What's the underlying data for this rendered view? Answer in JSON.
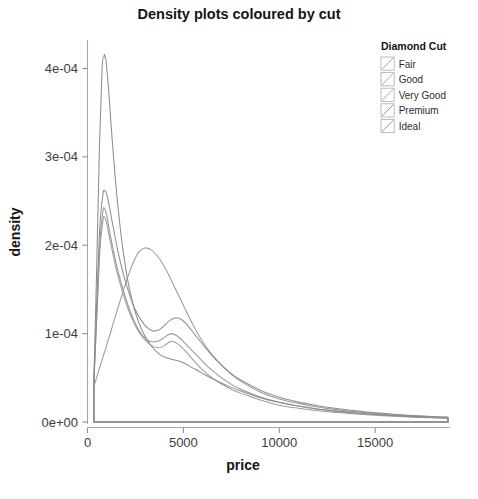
{
  "chart_data": {
    "type": "line",
    "title": "Density plots coloured by cut",
    "xlabel": "price",
    "ylabel": "density",
    "xlim": [
      0,
      18800
    ],
    "ylim": [
      0,
      0.00043
    ],
    "grid": false,
    "legend_position": "top-right",
    "legend_title": "Diamond Cut",
    "x_ticks": [
      {
        "value": 0,
        "label": "0"
      },
      {
        "value": 5000,
        "label": "5000"
      },
      {
        "value": 10000,
        "label": "10000"
      },
      {
        "value": 15000,
        "label": "15000"
      }
    ],
    "y_ticks": [
      {
        "value": 0.0,
        "label": "0e+00"
      },
      {
        "value": 0.0001,
        "label": "1e-04"
      },
      {
        "value": 0.0002,
        "label": "2e-04"
      },
      {
        "value": 0.0003,
        "label": "3e-04"
      },
      {
        "value": 0.0004,
        "label": "4e-04"
      }
    ],
    "series": [
      {
        "name": "Fair",
        "color": "#9a9a9a",
        "peak_price": 3050,
        "peak_density": 0.000197,
        "x": [
          330,
          600,
          900,
          1200,
          1500,
          1800,
          2100,
          2400,
          2700,
          3000,
          3300,
          3600,
          3900,
          4200,
          4600,
          5000,
          5500,
          6000,
          6500,
          7000,
          7500,
          8000,
          9000,
          10000,
          11000,
          12000,
          13000,
          14000,
          15000,
          16000,
          17000,
          18000,
          18800
        ],
        "y": [
          4e-05,
          5.9e-05,
          8e-05,
          0.000101,
          0.000123,
          0.000144,
          0.000164,
          0.000181,
          0.000193,
          0.000197,
          0.000195,
          0.000189,
          0.00018,
          0.000168,
          0.00015,
          0.000132,
          0.00011,
          9.1e-05,
          7.6e-05,
          6.4e-05,
          5.4e-05,
          4.6e-05,
          3.4e-05,
          2.6e-05,
          2.1e-05,
          1.7e-05,
          1.4e-05,
          1.15e-05,
          9.5e-06,
          8e-06,
          6.8e-06,
          5.8e-06,
          5e-06
        ]
      },
      {
        "name": "Good",
        "color": "#9d9d9d",
        "peak_price": 880,
        "peak_density": 0.000232,
        "x": [
          330,
          500,
          650,
          800,
          880,
          1000,
          1200,
          1500,
          1800,
          2100,
          2400,
          2700,
          3000,
          3300,
          3600,
          3900,
          4100,
          4350,
          4600,
          4900,
          5200,
          5600,
          6000,
          6500,
          7000,
          7600,
          8200,
          9000,
          10000,
          11000,
          12000,
          13000,
          14000,
          15000,
          16000,
          17000,
          18000,
          18800
        ],
        "y": [
          4.2e-05,
          0.000125,
          0.000195,
          0.000227,
          0.000232,
          0.000225,
          0.000203,
          0.000173,
          0.000149,
          0.000129,
          0.000113,
          0.000101,
          9.3e-05,
          8.7e-05,
          8.4e-05,
          8.5e-05,
          8.8e-05,
          9.1e-05,
          9e-05,
          8.5e-05,
          7.8e-05,
          6.8e-05,
          5.9e-05,
          5e-05,
          4.3e-05,
          3.6e-05,
          3.1e-05,
          2.5e-05,
          1.9e-05,
          1.55e-05,
          1.28e-05,
          1.08e-05,
          9e-06,
          7.6e-06,
          6.4e-06,
          5.5e-06,
          4.8e-06,
          4.3e-06
        ]
      },
      {
        "name": "Very Good",
        "color": "#979797",
        "peak_price": 880,
        "peak_density": 0.000242,
        "x": [
          330,
          500,
          650,
          800,
          880,
          1000,
          1200,
          1500,
          1800,
          2100,
          2400,
          2700,
          3000,
          3300,
          3600,
          3900,
          4150,
          4400,
          4700,
          5000,
          5400,
          5800,
          6300,
          6800,
          7400,
          8000,
          8800,
          9600,
          10500,
          11500,
          12500,
          13500,
          14500,
          15500,
          16500,
          17500,
          18300,
          18800
        ],
        "y": [
          4.3e-05,
          0.000132,
          0.000205,
          0.000238,
          0.000242,
          0.000234,
          0.00021,
          0.000179,
          0.000154,
          0.000133,
          0.000116,
          0.000103,
          9.5e-05,
          9.1e-05,
          9.1e-05,
          9.4e-05,
          9.8e-05,
          0.0001,
          9.7e-05,
          9.1e-05,
          8.2e-05,
          7.3e-05,
          6.2e-05,
          5.3e-05,
          4.4e-05,
          3.7e-05,
          3e-05,
          2.45e-05,
          2e-05,
          1.62e-05,
          1.33e-05,
          1.1e-05,
          9.2e-06,
          7.7e-06,
          6.5e-06,
          5.5e-06,
          4.9e-06,
          4.6e-06
        ]
      },
      {
        "name": "Premium",
        "color": "#8f8f8f",
        "peak_price": 900,
        "peak_density": 0.000262,
        "x": [
          330,
          500,
          650,
          800,
          900,
          1050,
          1250,
          1550,
          1850,
          2150,
          2450,
          2800,
          3100,
          3400,
          3700,
          4000,
          4300,
          4600,
          4900,
          5200,
          5600,
          6000,
          6500,
          7000,
          7600,
          8200,
          9000,
          10000,
          11000,
          12000,
          13000,
          14000,
          15000,
          16000,
          17000,
          18000,
          18800
        ],
        "y": [
          4.5e-05,
          0.000145,
          0.000224,
          0.000257,
          0.000262,
          0.000254,
          0.000231,
          0.000197,
          0.000169,
          0.000147,
          0.000129,
          0.000115,
          0.000107,
          0.000103,
          0.000104,
          0.000109,
          0.000115,
          0.000118,
          0.000116,
          0.00011,
          9.9e-05,
          8.8e-05,
          7.5e-05,
          6.4e-05,
          5.3e-05,
          4.5e-05,
          3.6e-05,
          2.8e-05,
          2.25e-05,
          1.85e-05,
          1.52e-05,
          1.26e-05,
          1.05e-05,
          8.8e-06,
          7.4e-06,
          6.2e-06,
          5.5e-06
        ]
      },
      {
        "name": "Ideal",
        "color": "#8c8c8c",
        "peak_price": 900,
        "peak_density": 0.000415,
        "x": [
          330,
          480,
          620,
          760,
          860,
          900,
          980,
          1100,
          1300,
          1550,
          1800,
          2100,
          2400,
          2700,
          3000,
          3400,
          3800,
          4200,
          4600,
          5000,
          5500,
          6000,
          6600,
          7200,
          8000,
          9000,
          10000,
          11000,
          12000,
          13000,
          14000,
          15000,
          16000,
          17000,
          18000,
          18800
        ],
        "y": [
          4.6e-05,
          0.000175,
          0.00031,
          0.0004,
          0.000414,
          0.000415,
          0.000406,
          0.000376,
          0.000316,
          0.000252,
          0.000203,
          0.00016,
          0.000131,
          0.000111,
          9.7e-05,
          8.4e-05,
          7.6e-05,
          7.2e-05,
          7e-05,
          6.7e-05,
          6.1e-05,
          5.5e-05,
          4.8e-05,
          4.2e-05,
          3.5e-05,
          2.75e-05,
          2.2e-05,
          1.8e-05,
          1.48e-05,
          1.23e-05,
          1.03e-05,
          8.6e-06,
          7.2e-06,
          6.1e-06,
          5.2e-06,
          4.6e-06
        ]
      }
    ]
  },
  "legend": {
    "title": "Diamond Cut",
    "items": [
      {
        "label": "Fair",
        "color": "#9a9a9a"
      },
      {
        "label": "Good",
        "color": "#9d9d9d"
      },
      {
        "label": "Very Good",
        "color": "#979797"
      },
      {
        "label": "Premium",
        "color": "#8f8f8f"
      },
      {
        "label": "Ideal",
        "color": "#8c8c8c"
      }
    ]
  }
}
